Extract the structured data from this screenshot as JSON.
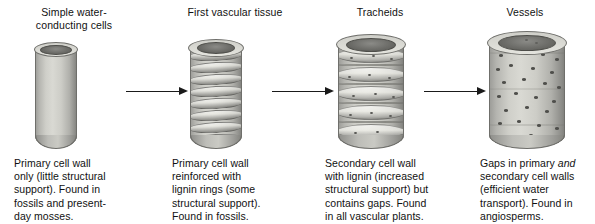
{
  "figure": {
    "background_color": "#ffffff",
    "ink_color": "#111111",
    "cell_color": "#cfcfc9"
  },
  "stages": [
    {
      "id": "simple-water-conducting-cells",
      "title": "Simple water-\nconducting cells",
      "title_line1": "Simple water-",
      "title_line2": "conducting cells",
      "caption": "Primary cell wall only (little structural support). Found in fossils and present-day mosses.",
      "caption_lines": [
        "Primary cell wall",
        "only (little structural",
        "support). Found in",
        "fossils and present-",
        "day mosses."
      ],
      "cell_features": "smooth thin primary wall, open lumen"
    },
    {
      "id": "first-vascular-tissue",
      "title": "First vascular tissue",
      "title_line1": "First vascular tissue",
      "title_line2": "",
      "caption": "Primary cell wall reinforced with lignin rings (some structural support). Found in fossils.",
      "caption_lines": [
        "Primary cell wall",
        "reinforced with",
        "lignin rings (some",
        "structural support).",
        "Found in fossils."
      ],
      "cell_features": "helical lignin rings"
    },
    {
      "id": "tracheids",
      "title": "Tracheids",
      "title_line1": "Tracheids",
      "title_line2": "",
      "caption": "Secondary cell wall with lignin (increased structural support) but contains gaps. Found in all vascular plants.",
      "caption_lines": [
        "Secondary cell wall",
        "with lignin (increased",
        "structural support) but",
        "contains gaps. Found",
        "in all vascular plants."
      ],
      "cell_features": "banded secondary wall with pits"
    },
    {
      "id": "vessels",
      "title": "Vessels",
      "title_line1": "Vessels",
      "title_line2": "",
      "caption_before_italic": "Gaps in primary ",
      "caption_italic": "and",
      "caption_after_italic": " secondary cell walls (efficient water transport). Found in angiosperms.",
      "caption_lines": [
        "Gaps in primary and",
        "secondary cell walls",
        "(efficient water",
        "transport). Found in",
        "angiosperms."
      ],
      "cell_features": "wide tube, many pits, large perforated opening"
    }
  ],
  "arrows": [
    {
      "id": "arrow-1",
      "from": "simple-water-conducting-cells",
      "to": "first-vascular-tissue",
      "direction": "right"
    },
    {
      "id": "arrow-2",
      "from": "first-vascular-tissue",
      "to": "tracheids",
      "direction": "right"
    },
    {
      "id": "arrow-3",
      "from": "tracheids",
      "to": "vessels",
      "direction": "right"
    }
  ]
}
